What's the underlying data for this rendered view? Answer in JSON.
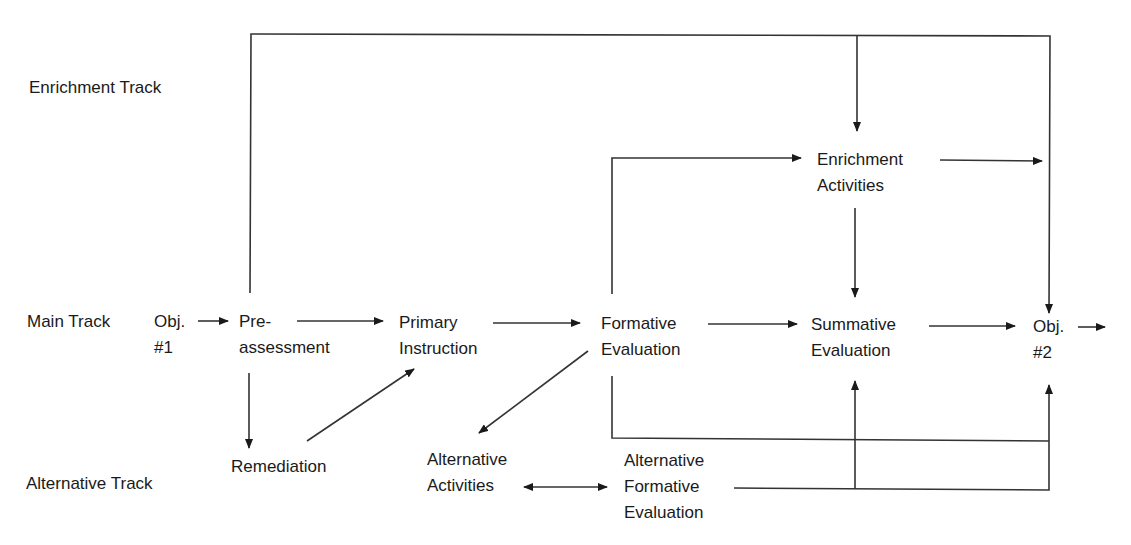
{
  "tracks": {
    "enrichment": "Enrichment Track",
    "main": "Main Track",
    "alternative": "Alternative Track"
  },
  "nodes": {
    "obj1": [
      "Obj.",
      "#1"
    ],
    "preassessment": [
      "Pre-",
      "assessment"
    ],
    "primary_instruction": [
      "Primary",
      "Instruction"
    ],
    "formative_evaluation": [
      "Formative",
      "Evaluation"
    ],
    "summative_evaluation": [
      "Summative",
      "Evaluation"
    ],
    "obj2": [
      "Obj.",
      "#2"
    ],
    "enrichment_activities": [
      "Enrichment",
      "Activities"
    ],
    "remediation": [
      "Remediation"
    ],
    "alternative_activities": [
      "Alternative",
      "Activities"
    ],
    "alternative_formative_evaluation": [
      "Alternative",
      "Formative",
      "Evaluation"
    ]
  },
  "edges": [
    {
      "from": "obj1",
      "to": "preassessment"
    },
    {
      "from": "preassessment",
      "to": "primary_instruction"
    },
    {
      "from": "primary_instruction",
      "to": "formative_evaluation"
    },
    {
      "from": "formative_evaluation",
      "to": "summative_evaluation"
    },
    {
      "from": "summative_evaluation",
      "to": "obj2"
    },
    {
      "from": "obj2",
      "to": "next"
    },
    {
      "from": "preassessment",
      "to": "remediation"
    },
    {
      "from": "remediation",
      "to": "primary_instruction"
    },
    {
      "from": "preassessment",
      "to": "enrichment_activities"
    },
    {
      "from": "preassessment",
      "to": "obj2"
    },
    {
      "from": "formative_evaluation",
      "to": "enrichment_activities"
    },
    {
      "from": "enrichment_activities",
      "to": "obj2"
    },
    {
      "from": "enrichment_activities",
      "to": "summative_evaluation"
    },
    {
      "from": "formative_evaluation",
      "to": "alternative_activities"
    },
    {
      "from": "formative_evaluation",
      "to": "obj2"
    },
    {
      "from": "alternative_activities",
      "to": "alternative_formative_evaluation",
      "bidirectional": true
    },
    {
      "from": "alternative_formative_evaluation",
      "to": "summative_evaluation"
    },
    {
      "from": "alternative_formative_evaluation",
      "to": "obj2"
    }
  ]
}
